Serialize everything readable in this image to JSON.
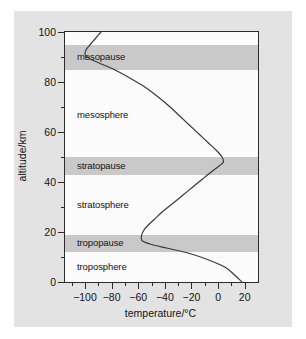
{
  "chart_data": {
    "type": "line",
    "title": "",
    "xlabel": "temperature/°C",
    "ylabel": "altitude/km",
    "xlim": [
      -115,
      30
    ],
    "ylim": [
      0,
      100
    ],
    "grid": false,
    "legend": "none",
    "x_ticks": [
      {
        "value": -100,
        "label": "−100"
      },
      {
        "value": -80,
        "label": "−80"
      },
      {
        "value": -60,
        "label": "−60"
      },
      {
        "value": -40,
        "label": "−40"
      },
      {
        "value": -20,
        "label": "−20"
      },
      {
        "value": 0,
        "label": "0"
      },
      {
        "value": 20,
        "label": "20"
      }
    ],
    "x_minor_ticks": [
      -110,
      -90,
      -70,
      -50,
      -30,
      -10,
      10,
      30
    ],
    "y_ticks": [
      {
        "value": 0,
        "label": "0"
      },
      {
        "value": 20,
        "label": "20"
      },
      {
        "value": 40,
        "label": "40"
      },
      {
        "value": 60,
        "label": "60"
      },
      {
        "value": 80,
        "label": "80"
      },
      {
        "value": 100,
        "label": "100"
      }
    ],
    "y_minor_ticks": [
      10,
      30,
      50,
      70,
      90
    ],
    "series": [
      {
        "name": "temperature profile",
        "points": [
          [
            18,
            0
          ],
          [
            12,
            3
          ],
          [
            5,
            6
          ],
          [
            -8,
            9
          ],
          [
            -22,
            11.5
          ],
          [
            -38,
            13.5
          ],
          [
            -50,
            15
          ],
          [
            -57,
            16.5
          ],
          [
            -57.5,
            18.5
          ],
          [
            -56,
            20.5
          ],
          [
            -53,
            22.5
          ],
          [
            -48,
            25
          ],
          [
            -42,
            28
          ],
          [
            -35,
            31
          ],
          [
            -27,
            34.5
          ],
          [
            -19,
            38
          ],
          [
            -11,
            41.5
          ],
          [
            -4,
            44.5
          ],
          [
            1,
            46.5
          ],
          [
            4,
            48
          ],
          [
            3,
            50
          ],
          [
            -1,
            52.5
          ],
          [
            -7,
            55.5
          ],
          [
            -14,
            59
          ],
          [
            -21,
            62.5
          ],
          [
            -28,
            66
          ],
          [
            -36,
            70
          ],
          [
            -45,
            74
          ],
          [
            -55,
            78
          ],
          [
            -66,
            81.5
          ],
          [
            -78,
            85
          ],
          [
            -89,
            87.5
          ],
          [
            -97,
            89.5
          ],
          [
            -100,
            91
          ],
          [
            -99,
            93
          ],
          [
            -96,
            95
          ],
          [
            -92,
            97.5
          ],
          [
            -88,
            100
          ]
        ]
      }
    ],
    "bands": [
      {
        "name": "tropopause",
        "label": "tropopause",
        "y_from": 12,
        "y_to": 19
      },
      {
        "name": "stratopause",
        "label": "stratopause",
        "y_from": 43,
        "y_to": 50
      },
      {
        "name": "mesopause",
        "label": "mesopause",
        "y_from": 85,
        "y_to": 95
      }
    ],
    "layer_labels": [
      {
        "name": "troposphere",
        "label": "troposphere",
        "y": 6
      },
      {
        "name": "stratosphere",
        "label": "stratosphere",
        "y": 31
      },
      {
        "name": "mesosphere",
        "label": "mesosphere",
        "y": 67
      }
    ],
    "colors": {
      "figure_background": "#e3e3e3",
      "plot_background": "#fbfbfb",
      "axis": "#2b2b2b",
      "band": "#c9c9c9",
      "curve": "#3a3a3a",
      "text": "#141414"
    }
  }
}
